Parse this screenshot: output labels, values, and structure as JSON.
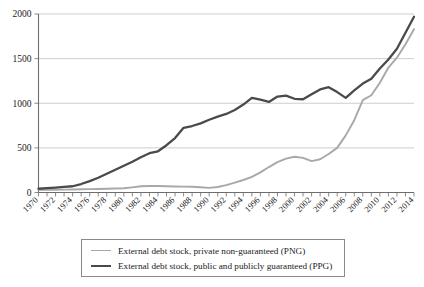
{
  "chart_data": {
    "type": "line",
    "title": "",
    "xlabel": "",
    "ylabel": "",
    "xlim": [
      1970,
      2014
    ],
    "ylim": [
      0,
      2000
    ],
    "grid": true,
    "legend_position": "bottom",
    "yticks": [
      0,
      500,
      1000,
      1500,
      2000
    ],
    "ytick_labels": [
      "0",
      "500",
      "1000",
      "1500",
      "2000"
    ],
    "x": [
      1970,
      1971,
      1972,
      1973,
      1974,
      1975,
      1976,
      1977,
      1978,
      1979,
      1980,
      1981,
      1982,
      1983,
      1984,
      1985,
      1986,
      1987,
      1988,
      1989,
      1990,
      1991,
      1992,
      1993,
      1994,
      1995,
      1996,
      1997,
      1998,
      1999,
      2000,
      2001,
      2002,
      2003,
      2004,
      2005,
      2006,
      2007,
      2008,
      2009,
      2010,
      2011,
      2012,
      2013,
      2014
    ],
    "xtick_labels": [
      "1970",
      "1972",
      "1974",
      "1976",
      "1978",
      "1980",
      "1982",
      "1984",
      "1986",
      "1988",
      "1990",
      "1992",
      "1994",
      "1996",
      "1998",
      "2000",
      "2002",
      "2004",
      "2006",
      "2008",
      "2010",
      "2012",
      "2014"
    ],
    "xtick_label_rotation": 45,
    "series": [
      {
        "name": "External debt stock, private non-guaranteed (PNG)",
        "short_name": "PNG",
        "color": "#a8a8a8",
        "stroke_width": 1.9,
        "values": [
          30,
          30,
          30,
          32,
          34,
          36,
          38,
          40,
          42,
          44,
          48,
          58,
          70,
          72,
          72,
          70,
          68,
          66,
          64,
          58,
          52,
          62,
          82,
          110,
          140,
          175,
          225,
          285,
          340,
          380,
          400,
          388,
          352,
          372,
          432,
          500,
          640,
          810,
          1035,
          1090,
          1230,
          1400,
          1510,
          1660,
          1830
        ]
      },
      {
        "name": "External debt stock, public and publicly guaranteed (PPG)",
        "short_name": "PPG",
        "color": "#4a4a4a",
        "stroke_width": 2.3,
        "values": [
          42,
          48,
          55,
          62,
          70,
          95,
          128,
          165,
          210,
          255,
          300,
          345,
          395,
          440,
          462,
          530,
          610,
          725,
          745,
          775,
          815,
          850,
          880,
          925,
          985,
          1060,
          1040,
          1015,
          1075,
          1085,
          1050,
          1045,
          1100,
          1155,
          1180,
          1125,
          1060,
          1145,
          1220,
          1275,
          1390,
          1490,
          1610,
          1790,
          1970
        ]
      }
    ]
  },
  "legend": {
    "entries": [
      {
        "label": "External debt stock, private non-guaranteed (PNG)"
      },
      {
        "label": "External debt stock, public and publicly guaranteed (PPG)"
      }
    ]
  },
  "colors": {
    "png_line": "#a8a8a8",
    "ppg_line": "#4a4a4a",
    "gridline": "#b9b9b9",
    "axis": "#6d6d6d",
    "text": "#1a1a1a",
    "legend_border": "#8a8a8a",
    "background": "#ffffff"
  }
}
